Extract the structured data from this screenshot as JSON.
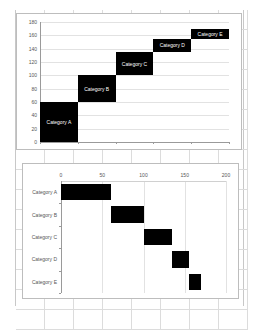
{
  "chart_data": [
    {
      "type": "bar",
      "orientation": "vertical-stacked-waterfall",
      "title": "",
      "xlabel": "",
      "ylabel": "",
      "ylim": [
        0,
        180
      ],
      "yticks": [
        0,
        20,
        40,
        60,
        80,
        100,
        120,
        140,
        160,
        180
      ],
      "grid": true,
      "legend": "none",
      "categories": [
        "Category A",
        "Category B",
        "Category C",
        "Category D",
        "Category E"
      ],
      "series": [
        {
          "name": "start",
          "values": [
            0,
            60,
            100,
            135,
            155
          ],
          "hidden": true
        },
        {
          "name": "duration",
          "values": [
            60,
            40,
            35,
            20,
            15
          ]
        }
      ],
      "data_labels": [
        "Category A",
        "Category B",
        "Category C",
        "Category D",
        "Category E"
      ],
      "bar_color": "#000000"
    },
    {
      "type": "bar",
      "orientation": "horizontal-gantt",
      "title": "",
      "xlabel": "",
      "ylabel": "",
      "xlim": [
        0,
        200
      ],
      "xticks": [
        0,
        50,
        100,
        150,
        200
      ],
      "x_axis_position": "top",
      "grid": true,
      "legend": "none",
      "categories": [
        "Category A",
        "Category B",
        "Category C",
        "Category D",
        "Category E"
      ],
      "series": [
        {
          "name": "start",
          "values": [
            0,
            60,
            100,
            135,
            155
          ],
          "hidden": true
        },
        {
          "name": "duration",
          "values": [
            60,
            40,
            35,
            20,
            15
          ]
        }
      ],
      "bar_color": "#000000"
    }
  ],
  "top_chart": {
    "yticks": [
      "0",
      "20",
      "40",
      "60",
      "80",
      "100",
      "120",
      "140",
      "160",
      "180"
    ],
    "bars": [
      {
        "label": "Category A",
        "start": 0,
        "value": 60
      },
      {
        "label": "Category B",
        "start": 60,
        "value": 40
      },
      {
        "label": "Category C",
        "start": 100,
        "value": 35
      },
      {
        "label": "Category D",
        "start": 135,
        "value": 20
      },
      {
        "label": "Category E",
        "start": 155,
        "value": 15
      }
    ]
  },
  "bottom_chart": {
    "xticks": [
      "0",
      "50",
      "100",
      "150",
      "200"
    ],
    "categories": [
      "Category A",
      "Category B",
      "Category C",
      "Category D",
      "Category E"
    ],
    "bars": [
      {
        "start": 0,
        "value": 60
      },
      {
        "start": 60,
        "value": 40
      },
      {
        "start": 100,
        "value": 35
      },
      {
        "start": 135,
        "value": 20
      },
      {
        "start": 155,
        "value": 15
      }
    ]
  }
}
